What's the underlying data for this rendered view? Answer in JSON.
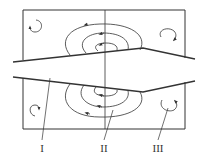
{
  "diagram": {
    "colors": {
      "stroke": "#333333",
      "background": "#ffffff"
    },
    "labels": [
      {
        "id": "zone-1",
        "text": "I"
      },
      {
        "id": "zone-2",
        "text": "II"
      },
      {
        "id": "zone-3",
        "text": "III"
      }
    ]
  }
}
